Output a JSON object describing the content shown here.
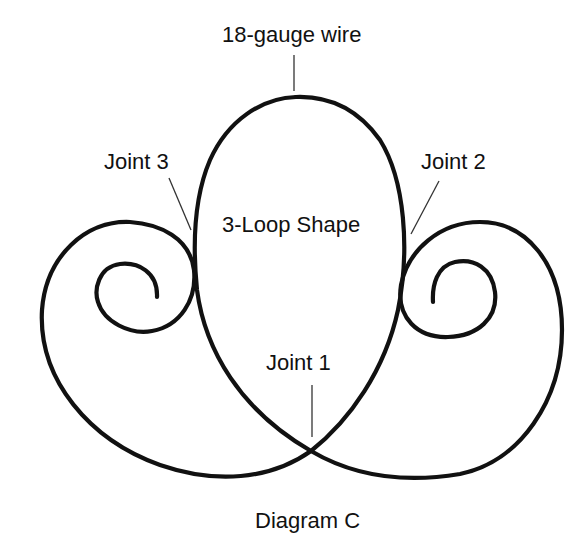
{
  "diagram": {
    "title": "Diagram C",
    "labels": {
      "wire": "18-gauge wire",
      "joint3": "Joint 3",
      "joint2": "Joint 2",
      "shape": "3-Loop Shape",
      "joint1": "Joint 1"
    },
    "caption": "Diagram C",
    "colors": {
      "stroke": "#111111",
      "background": "#ffffff"
    },
    "elements": [
      {
        "id": "central-loop",
        "type": "teardrop-loop",
        "description": "Tall central loop whose wire ends cross at Joint 1"
      },
      {
        "id": "left-spiral",
        "type": "spiral",
        "description": "Left scroll spiraling inward clockwise, touching central loop at Joint 3"
      },
      {
        "id": "right-spiral",
        "type": "spiral",
        "description": "Right scroll spiraling inward, touching central loop at Joint 2"
      },
      {
        "id": "joint-1",
        "type": "crossing",
        "description": "Crossing point at bottom of central loop"
      }
    ]
  }
}
